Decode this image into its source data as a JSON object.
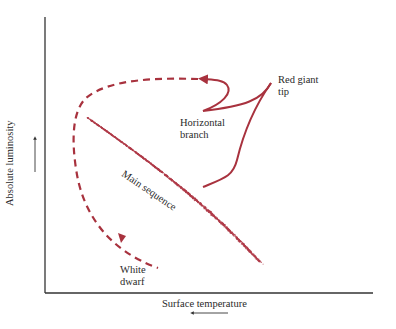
{
  "figure": {
    "type": "Hertzsprung-Russell evolutionary track diagram",
    "axes": {
      "y_label": "Absolute luminosity",
      "y_arrow_direction": "up",
      "x_label": "Surface temperature",
      "x_arrow_direction": "left"
    },
    "labels": {
      "red_giant_tip": [
        "Red giant",
        "tip"
      ],
      "horizontal_branch": [
        "Horizontal",
        "branch"
      ],
      "main_sequence": "Main sequence",
      "white_dwarf": [
        "White",
        "dwarf"
      ]
    },
    "colors": {
      "track": "#a8323e",
      "scatter": "#b03a48",
      "axis": "#333333",
      "text": "#2a2a2a"
    },
    "tracks": [
      {
        "name": "main-sequence-to-red-giant-tip",
        "style": "solid"
      },
      {
        "name": "red-giant-tip-to-horizontal-branch",
        "style": "solid"
      },
      {
        "name": "horizontal-branch-to-white-dwarf",
        "style": "dashed"
      }
    ]
  }
}
